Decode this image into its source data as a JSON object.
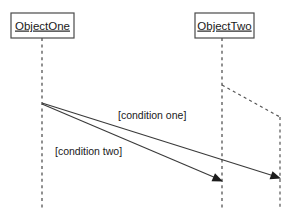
{
  "diagram": {
    "type": "uml-sequence-diagram",
    "width": 301,
    "height": 220,
    "background_color": "#ffffff",
    "line_color": "#555555",
    "message_color": "#3a3a3a",
    "text_color": "#1a1a1a"
  },
  "objects": [
    {
      "id": "object-one",
      "label": "ObjectOne",
      "box": {
        "x": 11,
        "y": 13,
        "width": 63,
        "height": 25
      },
      "lifeline_x": 42,
      "lifeline_top": 38,
      "lifeline_bottom": 210
    },
    {
      "id": "object-two",
      "label": "ObjectTwo",
      "box": {
        "x": 195,
        "y": 13,
        "width": 59,
        "height": 25
      },
      "lifeline_x": 222,
      "lifeline_top": 38,
      "lifeline_bottom": 210
    }
  ],
  "branch": {
    "id": "object-two-branch",
    "from_x": 222,
    "from_y": 85,
    "bend_x": 280,
    "bend_y": 117,
    "bottom_y": 210
  },
  "messages": [
    {
      "id": "message-condition-one",
      "label": "[condition one]",
      "label_x": 118,
      "label_y": 116,
      "from_x": 42,
      "from_y": 103,
      "to_x": 280,
      "to_y": 178
    },
    {
      "id": "message-condition-two",
      "label": "[condition two]",
      "label_x": 55,
      "label_y": 152,
      "from_x": 42,
      "from_y": 104,
      "to_x": 222,
      "to_y": 181
    }
  ]
}
